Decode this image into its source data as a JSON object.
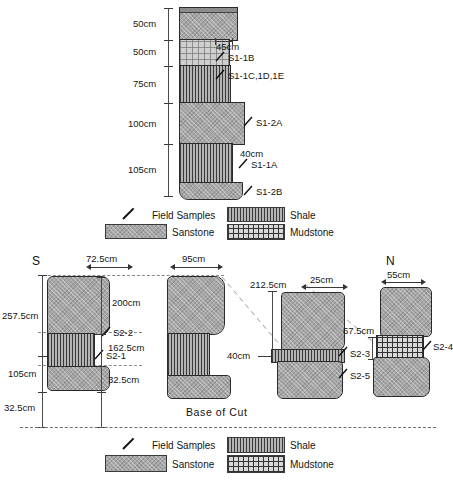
{
  "figure": {
    "base_label": "Base of Cut",
    "direction_south": "S",
    "direction_north": "N"
  },
  "legend": {
    "field_samples": "Field Samples",
    "sandstone": "Sanstone",
    "shale": "Shale",
    "mudstone": "Mudstone",
    "icon_field_samples": "slash-tick-icon",
    "icon_sandstone": "sandstone-swatch-icon",
    "icon_shale": "shale-swatch-icon",
    "icon_mudstone": "mudstone-swatch-icon"
  },
  "top_section": {
    "scale_labels": [
      "50cm",
      "50cm",
      "75cm",
      "100cm",
      "105cm"
    ],
    "annotations": [
      {
        "thickness": "45cm",
        "sample": "S1-1B"
      },
      {
        "thickness": "",
        "sample": "S1-1C,1D,1E"
      },
      {
        "thickness": "",
        "sample": "S1-2A"
      },
      {
        "thickness": "40cm",
        "sample": "S1-1A"
      },
      {
        "thickness": "",
        "sample": "S1-2B"
      }
    ],
    "beds": [
      {
        "name": "bed-1-sandstone",
        "lithology": "Sanstone",
        "height_label": "50cm"
      },
      {
        "name": "bed-2-mudstone",
        "lithology": "Mudstone",
        "height_label": "50cm"
      },
      {
        "name": "bed-3-shale",
        "lithology": "Shale",
        "height_label": "75cm"
      },
      {
        "name": "bed-4-sandstone",
        "lithology": "Sanstone",
        "height_label": "100cm"
      },
      {
        "name": "bed-5-shale",
        "lithology": "Shale",
        "height_label": "105cm"
      },
      {
        "name": "bed-6-sandstone",
        "lithology": "Sanstone",
        "height_label": ""
      }
    ]
  },
  "bottom_section": {
    "left_scale": [
      "257.5cm",
      "105cm",
      "32.5cm"
    ],
    "columns": [
      {
        "id": "column-1",
        "width_label": "72.5cm",
        "samples": [
          "S2-2",
          "S2-1"
        ],
        "bed_labels": [
          "",
          "",
          ""
        ],
        "base_label": "32.5cm"
      },
      {
        "id": "column-2",
        "width_label": "95cm",
        "height_label": "200cm",
        "mid_label": "162.5cm",
        "base_label": "32.5cm",
        "samples": []
      },
      {
        "id": "column-3",
        "width_label": "25cm",
        "height_label": "212.5cm",
        "mid_label": "40cm",
        "samples": [
          "S2-3",
          "S2-5"
        ]
      },
      {
        "id": "column-4",
        "width_label": "55cm",
        "height_label": "67.5cm",
        "samples": [
          "S2-4"
        ]
      }
    ]
  },
  "colors": {
    "sandstone": "#a6a6a6",
    "shale": "#b3b3b3",
    "mudstone": "#d8d8d8",
    "outline": "#2b2b2b",
    "dash": "#8a8a8a",
    "text": "#151515"
  }
}
